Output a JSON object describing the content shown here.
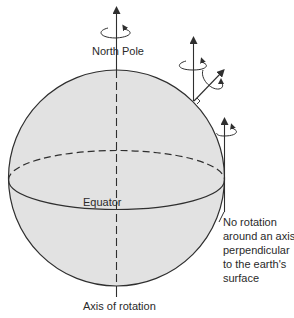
{
  "figure": {
    "type": "diagram",
    "colors": {
      "sphere_fill": "#e2e2e2",
      "line": "#2f2f2f",
      "background": "#ffffff"
    }
  },
  "labels": {
    "north_pole": "North Pole",
    "equator": "Equator",
    "axis_of_rotation": "Axis of rotation",
    "annotation_lines": [
      "No rotation",
      "around an axis",
      "perpendicular",
      "to the earth's",
      "surface"
    ]
  },
  "arrows": [
    {
      "name": "north-pole-axis",
      "position": "north pole",
      "direction": "vertical",
      "rotation": "counterclockwise loop"
    },
    {
      "name": "mid-latitude-vertical",
      "position": "mid-latitude",
      "direction": "vertical",
      "rotation": "counterclockwise loop"
    },
    {
      "name": "mid-latitude-normal",
      "position": "mid-latitude",
      "direction": "perpendicular to surface",
      "rotation": "loop"
    },
    {
      "name": "equator-vertical",
      "position": "equator",
      "direction": "vertical",
      "rotation": "counterclockwise loop"
    }
  ]
}
